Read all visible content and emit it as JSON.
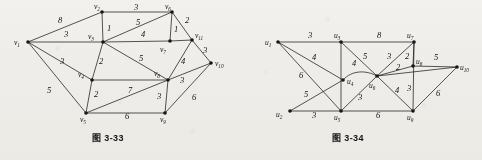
{
  "figures": [
    {
      "id": "fig-3-33",
      "caption": "图 3-33",
      "caption_x": 92,
      "caption_y": 133,
      "nodes": [
        {
          "id": "v1",
          "label": "v",
          "sub": "1",
          "x": 28,
          "y": 42,
          "lx": 14,
          "ly": 45
        },
        {
          "id": "v2",
          "label": "v",
          "sub": "2",
          "x": 102,
          "y": 12,
          "lx": 94,
          "ly": 9
        },
        {
          "id": "v3",
          "label": "v",
          "sub": "3",
          "x": 103,
          "y": 42,
          "lx": 88,
          "ly": 39
        },
        {
          "id": "v4",
          "label": "v",
          "sub": "4",
          "x": 92,
          "y": 80,
          "lx": 78,
          "ly": 77
        },
        {
          "id": "v5",
          "label": "v",
          "sub": "5",
          "x": 86,
          "y": 113,
          "lx": 80,
          "ly": 122
        },
        {
          "id": "v6",
          "label": "v",
          "sub": "6",
          "x": 172,
          "y": 12,
          "lx": 165,
          "ly": 9
        },
        {
          "id": "v7",
          "label": "v",
          "sub": "7",
          "x": 170,
          "y": 41,
          "lx": 160,
          "ly": 50
        },
        {
          "id": "v8",
          "label": "v",
          "sub": "8",
          "x": 168,
          "y": 80,
          "lx": 155,
          "ly": 74
        },
        {
          "id": "v9",
          "label": "v",
          "sub": "9",
          "x": 165,
          "y": 113,
          "lx": 161,
          "ly": 122
        },
        {
          "id": "v10",
          "label": "v",
          "sub": "10",
          "x": 211,
          "y": 63,
          "lx": 215,
          "ly": 66
        },
        {
          "id": "v11",
          "label": "v",
          "sub": "11",
          "x": 192,
          "y": 40,
          "lx": 195,
          "ly": 38
        }
      ],
      "edges": [
        {
          "from": "v1",
          "to": "v2",
          "weight": "8",
          "wx": 58,
          "wy": 23
        },
        {
          "from": "v1",
          "to": "v3",
          "weight": "3",
          "wx": 64,
          "wy": 37
        },
        {
          "from": "v1",
          "to": "v4",
          "weight": "3",
          "wx": 60,
          "wy": 64
        },
        {
          "from": "v1",
          "to": "v5",
          "weight": "5",
          "wx": 47,
          "wy": 93
        },
        {
          "from": "v2",
          "to": "v3",
          "weight": "1",
          "wx": 107,
          "wy": 31
        },
        {
          "from": "v2",
          "to": "v6",
          "weight": "3",
          "wx": 134,
          "wy": 9
        },
        {
          "from": "v3",
          "to": "v6",
          "weight": "5",
          "wx": 136,
          "wy": 24
        },
        {
          "from": "v3",
          "to": "v7",
          "weight": "4",
          "wx": 141,
          "wy": 36
        },
        {
          "from": "v3",
          "to": "v4",
          "weight": "2",
          "wx": 99,
          "wy": 63
        },
        {
          "from": "v3",
          "to": "v8",
          "weight": "5",
          "wx": 139,
          "wy": 60
        },
        {
          "from": "v6",
          "to": "v7",
          "weight": "1",
          "wx": 174,
          "wy": 30
        },
        {
          "from": "v6",
          "to": "v11",
          "weight": "2",
          "wx": 185,
          "wy": 22
        },
        {
          "from": "v7",
          "to": "v11",
          "weight": "1",
          "wx": 0,
          "wy": 0
        },
        {
          "from": "v11",
          "to": "v10",
          "weight": "3",
          "wx": 203,
          "wy": 52
        },
        {
          "from": "v11",
          "to": "v8",
          "weight": "4",
          "wx": 181,
          "wy": 63
        },
        {
          "from": "v4",
          "to": "v8",
          "weight": "",
          "wx": 0,
          "wy": 0
        },
        {
          "from": "v4",
          "to": "v5",
          "weight": "2",
          "wx": 94,
          "wy": 96
        },
        {
          "from": "v5",
          "to": "v8",
          "weight": "7",
          "wx": 128,
          "wy": 92
        },
        {
          "from": "v5",
          "to": "v9",
          "weight": "6",
          "wx": 125,
          "wy": 118
        },
        {
          "from": "v8",
          "to": "v9",
          "weight": "3",
          "wx": 157,
          "wy": 98
        },
        {
          "from": "v8",
          "to": "v10",
          "weight": "3",
          "wx": 180,
          "wy": 82
        },
        {
          "from": "v9",
          "to": "v10",
          "weight": "6",
          "wx": 192,
          "wy": 99
        }
      ]
    },
    {
      "id": "fig-3-34",
      "caption": "图 3-34",
      "caption_x": 332,
      "caption_y": 133,
      "nodes": [
        {
          "id": "u1",
          "label": "u",
          "sub": "1",
          "x": 278,
          "y": 42,
          "lx": 265,
          "ly": 45
        },
        {
          "id": "u2",
          "label": "u",
          "sub": "2",
          "x": 290,
          "y": 111,
          "lx": 277,
          "ly": 117
        },
        {
          "id": "u3",
          "label": "u",
          "sub": "3",
          "x": 341,
          "y": 42,
          "lx": 334,
          "ly": 38
        },
        {
          "id": "u4",
          "label": "u",
          "sub": "4",
          "x": 343,
          "y": 80,
          "lx": 347,
          "ly": 84
        },
        {
          "id": "u5",
          "label": "u",
          "sub": "5",
          "x": 341,
          "y": 111,
          "lx": 334,
          "ly": 120
        },
        {
          "id": "u6",
          "label": "u",
          "sub": "6",
          "x": 377,
          "y": 76,
          "lx": 369,
          "ly": 87
        },
        {
          "id": "u7",
          "label": "u",
          "sub": "7",
          "x": 414,
          "y": 42,
          "lx": 407,
          "ly": 38
        },
        {
          "id": "u8",
          "label": "u",
          "sub": "8",
          "x": 413,
          "y": 66,
          "lx": 416,
          "ly": 63
        },
        {
          "id": "u9",
          "label": "u",
          "sub": "9",
          "x": 413,
          "y": 111,
          "lx": 406,
          "ly": 120
        },
        {
          "id": "u10",
          "label": "u",
          "sub": "10",
          "x": 457,
          "y": 67,
          "lx": 460,
          "ly": 70
        }
      ],
      "edges": [
        {
          "from": "u1",
          "to": "u3",
          "weight": "3",
          "wx": 310,
          "wy": 38
        },
        {
          "from": "u1",
          "to": "u4",
          "weight": "4",
          "wx": 313,
          "wy": 60
        },
        {
          "from": "u1",
          "to": "u5",
          "weight": "6",
          "wx": 300,
          "wy": 78
        },
        {
          "from": "u1",
          "to": "u9",
          "weight": "",
          "wx": 0,
          "wy": 0
        },
        {
          "from": "u2",
          "to": "u4",
          "weight": "5",
          "wx": 305,
          "wy": 96
        },
        {
          "from": "u2",
          "to": "u5",
          "weight": "3",
          "wx": 313,
          "wy": 117
        },
        {
          "from": "u3",
          "to": "u5",
          "weight": "",
          "wx": 0,
          "wy": 0
        },
        {
          "from": "u3",
          "to": "u6",
          "weight": "5",
          "wx": 364,
          "wy": 58
        },
        {
          "from": "u3",
          "to": "u7",
          "weight": "8",
          "wx": 377,
          "wy": 38
        },
        {
          "from": "u4",
          "to": "u5",
          "weight": "",
          "wx": 0,
          "wy": 0
        },
        {
          "from": "u4",
          "to": "u6",
          "weight": "4",
          "wx": 354,
          "wy": 67
        },
        {
          "from": "u5",
          "to": "u6",
          "weight": "3",
          "wx": 359,
          "wy": 99
        },
        {
          "from": "u5",
          "to": "u9",
          "weight": "6",
          "wx": 377,
          "wy": 117
        },
        {
          "from": "u6",
          "to": "u7",
          "weight": "3",
          "wx": 388,
          "wy": 59
        },
        {
          "from": "u6",
          "to": "u8",
          "weight": "2",
          "wx": 397,
          "wy": 70
        },
        {
          "from": "u6",
          "to": "u9",
          "weight": "4",
          "wx": 396,
          "wy": 92
        },
        {
          "from": "u6",
          "to": "u10",
          "weight": "",
          "wx": 0,
          "wy": 0
        },
        {
          "from": "u7",
          "to": "u8",
          "weight": "2",
          "wx": 406,
          "wy": 60
        },
        {
          "from": "u7",
          "to": "u9",
          "weight": "",
          "wx": 0,
          "wy": 0
        },
        {
          "from": "u8",
          "to": "u9",
          "weight": "3",
          "wx": 408,
          "wy": 90
        },
        {
          "from": "u8",
          "to": "u10",
          "weight": "5",
          "wx": 435,
          "wy": 60
        },
        {
          "from": "u9",
          "to": "u10",
          "weight": "6",
          "wx": 437,
          "wy": 95
        }
      ]
    }
  ]
}
